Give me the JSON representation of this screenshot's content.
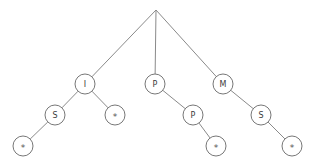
{
  "figure": {
    "background_color": "#ffffff",
    "line_color": "#8a8a8a",
    "node_stroke_color": "#777777",
    "node_fill_color": "#ffffff",
    "label_color": "#3b3b3b",
    "width": 313,
    "height": 167
  },
  "chart_data": {
    "type": "diagram",
    "diagram_type": "tree",
    "title": "",
    "node_radius": 10,
    "nodes": [
      {
        "id": "root",
        "label": "",
        "shape": "point",
        "x": 156,
        "y": 10,
        "level": 0
      },
      {
        "id": "n_I",
        "label": "I",
        "shape": "circle",
        "x": 85,
        "y": 84,
        "level": 1
      },
      {
        "id": "n_P1",
        "label": "P",
        "shape": "circle",
        "x": 155,
        "y": 84,
        "level": 1
      },
      {
        "id": "n_M",
        "label": "M",
        "shape": "circle",
        "x": 223,
        "y": 84,
        "level": 1
      },
      {
        "id": "n_S1",
        "label": "S",
        "shape": "circle",
        "x": 55,
        "y": 115,
        "level": 2
      },
      {
        "id": "n_st1",
        "label": "*",
        "shape": "circle",
        "x": 115,
        "y": 115,
        "level": 2
      },
      {
        "id": "n_P2",
        "label": "P",
        "shape": "circle",
        "x": 193,
        "y": 115,
        "level": 2
      },
      {
        "id": "n_S2",
        "label": "S",
        "shape": "circle",
        "x": 261,
        "y": 115,
        "level": 2
      },
      {
        "id": "n_st2",
        "label": "*",
        "shape": "circle",
        "x": 23,
        "y": 146,
        "level": 3
      },
      {
        "id": "n_st3",
        "label": "*",
        "shape": "circle",
        "x": 216,
        "y": 146,
        "level": 3
      },
      {
        "id": "n_st4",
        "label": "*",
        "shape": "circle",
        "x": 292,
        "y": 146,
        "level": 3
      }
    ],
    "edges": [
      {
        "from": "root",
        "to": "n_I"
      },
      {
        "from": "root",
        "to": "n_P1"
      },
      {
        "from": "root",
        "to": "n_M"
      },
      {
        "from": "n_I",
        "to": "n_S1"
      },
      {
        "from": "n_I",
        "to": "n_st1"
      },
      {
        "from": "n_P1",
        "to": "n_P2"
      },
      {
        "from": "n_M",
        "to": "n_S2"
      },
      {
        "from": "n_S1",
        "to": "n_st2"
      },
      {
        "from": "n_P2",
        "to": "n_st3"
      },
      {
        "from": "n_S2",
        "to": "n_st4"
      }
    ],
    "labels_in_order": [
      "I",
      "P",
      "M",
      "S",
      "*",
      "P",
      "S",
      "*",
      "*",
      "*"
    ]
  }
}
